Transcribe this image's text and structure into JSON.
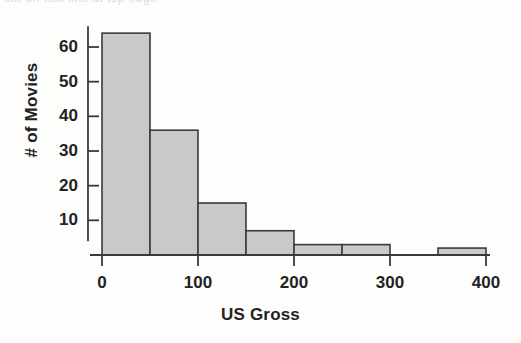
{
  "figure": {
    "kind": "histogram-figure",
    "artifact_text": "cut-off text line at top edge"
  },
  "chart_data": {
    "type": "bar",
    "subtype": "histogram",
    "title": "",
    "xlabel": "US Gross",
    "ylabel": "# of Movies",
    "bin_width": 50,
    "bin_edges": [
      0,
      50,
      100,
      150,
      200,
      250,
      300,
      350,
      400
    ],
    "categories": [
      "0-50",
      "50-100",
      "100-150",
      "150-200",
      "200-250",
      "250-300",
      "300-350",
      "350-400"
    ],
    "values": [
      64,
      36,
      15,
      7,
      3,
      3,
      0,
      2
    ],
    "xlim": [
      0,
      400
    ],
    "ylim": [
      0,
      68
    ],
    "xticks": [
      0,
      100,
      200,
      300,
      400
    ],
    "xtick_labels": [
      "0",
      "100",
      "200",
      "300",
      "400"
    ],
    "yticks": [
      10,
      20,
      30,
      40,
      50,
      60
    ],
    "ytick_labels": [
      "10",
      "20",
      "30",
      "40",
      "50",
      "60"
    ],
    "grid": false,
    "legend": false,
    "bar_fill": "#c9c9c9",
    "bar_stroke": "#3a3a3a",
    "axis_color": "#3a3a3a"
  }
}
